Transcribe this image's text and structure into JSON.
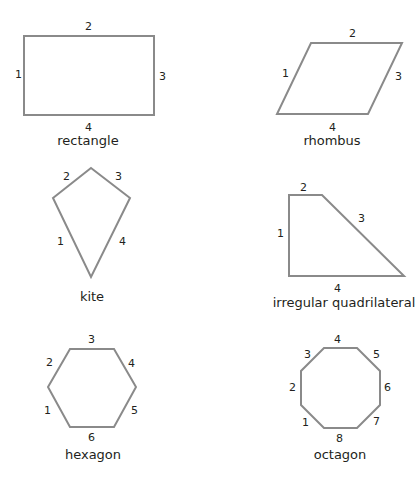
{
  "shapes": [
    {
      "name": "rectangle",
      "caption": "rectangle",
      "sides": [
        "1",
        "2",
        "3",
        "4"
      ]
    },
    {
      "name": "rhombus",
      "caption": "rhombus",
      "sides": [
        "1",
        "2",
        "3",
        "4"
      ]
    },
    {
      "name": "kite",
      "caption": "kite",
      "sides": [
        "1",
        "2",
        "3",
        "4"
      ]
    },
    {
      "name": "irregular-quadrilateral",
      "caption": "irregular quadrilateral",
      "sides": [
        "1",
        "2",
        "3",
        "4"
      ]
    },
    {
      "name": "hexagon",
      "caption": "hexagon",
      "sides": [
        "1",
        "2",
        "3",
        "4",
        "5",
        "6"
      ]
    },
    {
      "name": "octagon",
      "caption": "octagon",
      "sides": [
        "1",
        "2",
        "3",
        "4",
        "5",
        "6",
        "7",
        "8"
      ]
    }
  ],
  "colors": {
    "stroke": "#8a8a8a",
    "text": "#231f20"
  }
}
